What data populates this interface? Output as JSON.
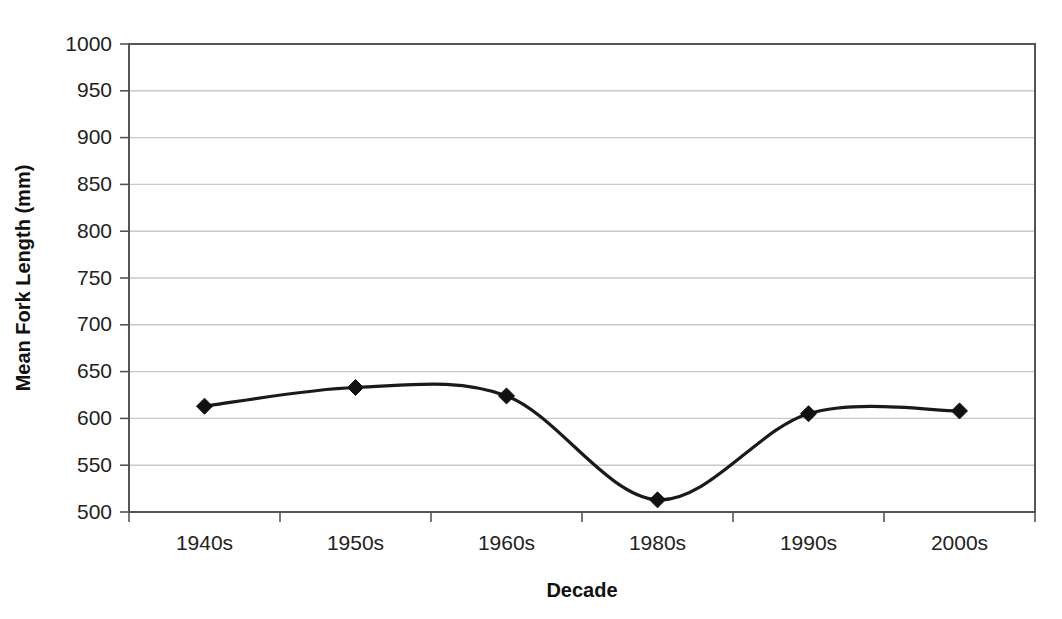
{
  "chart_data": {
    "type": "line",
    "title": "",
    "subtitle": "",
    "xlabel": "Decade",
    "ylabel": "Mean Fork Length (mm)",
    "categories": [
      "1940s",
      "1950s",
      "1960s",
      "1980s",
      "1990s",
      "2000s"
    ],
    "values": [
      613,
      633,
      624,
      513,
      605,
      608
    ],
    "series": [
      {
        "name": "Mean Fork Length",
        "values": [
          613,
          633,
          624,
          513,
          605,
          608
        ]
      }
    ],
    "ylim": [
      500,
      1000
    ],
    "ytick_labels": [
      "1000",
      "950",
      "900",
      "850",
      "800",
      "750",
      "700",
      "650",
      "600",
      "550",
      "500"
    ],
    "ytick_values": [
      1000,
      950,
      900,
      850,
      800,
      750,
      700,
      650,
      600,
      550,
      500
    ],
    "ytick_step": 50,
    "grid": true,
    "grid_axis": "y",
    "legend": false,
    "legend_position": "none",
    "marker": "diamond",
    "line_style": "smooth",
    "line_color": "#1a1a1a",
    "marker_color": "#111111",
    "grid_color": "#c9c9c9",
    "axis_color": "#555555",
    "background_color": "#ffffff",
    "xlabel_clipped": true,
    "annotations": []
  }
}
